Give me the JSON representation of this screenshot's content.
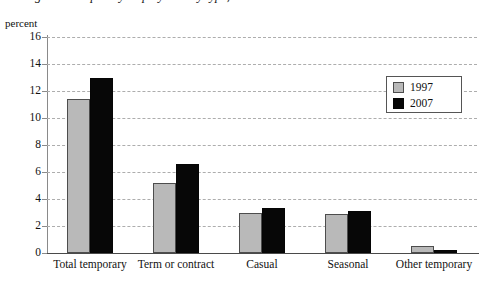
{
  "axis_unit_label": "percent",
  "title": "Figure 1  Temporary employment by type, 1997 and 2007",
  "legend": {
    "position": "upper-right",
    "entries": [
      {
        "label": "1997",
        "color": "#b9b9b9",
        "swatch": "gray-square-swatch"
      },
      {
        "label": "2007",
        "color": "#070707",
        "swatch": "black-square-swatch"
      }
    ]
  },
  "chart_data": {
    "type": "bar",
    "title": "Figure 1  Temporary employment by type, 1997 and 2007",
    "xlabel": "",
    "ylabel": "percent",
    "ylim": [
      0,
      16
    ],
    "yticks": [
      0,
      2,
      4,
      6,
      8,
      10,
      12,
      14,
      16
    ],
    "ytick_labels": [
      "0",
      "2",
      "4",
      "6",
      "8",
      "10",
      "12",
      "14",
      "16"
    ],
    "grid": true,
    "grid_style": "dashed-horizontal",
    "categories": [
      "Total temporary",
      "Term or contract",
      "Casual",
      "Seasonal",
      "Other temporary"
    ],
    "series": [
      {
        "name": "1997",
        "color": "#b9b9b9",
        "values": [
          11.4,
          5.2,
          3.0,
          2.9,
          0.5
        ]
      },
      {
        "name": "2007",
        "color": "#070707",
        "values": [
          13.0,
          6.6,
          3.3,
          3.1,
          0.2
        ]
      }
    ]
  }
}
